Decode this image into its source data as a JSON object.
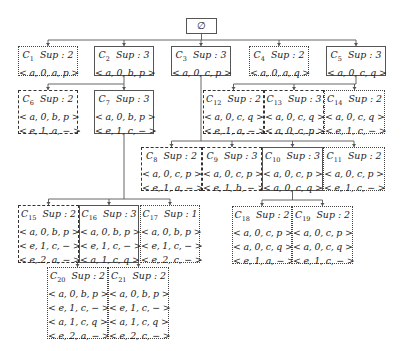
{
  "root": {
    "label": "∅",
    "box": [
      186,
      18,
      31,
      16
    ],
    "style": "solid"
  },
  "nodes": [
    {
      "id": "C1",
      "name": "C",
      "sub": "1",
      "sup_label": "Sup : 2",
      "tuples": [
        "< a, 0, a, p >"
      ],
      "style": "dotted",
      "box": [
        18,
        46,
        60,
        30
      ]
    },
    {
      "id": "C2",
      "name": "C",
      "sub": "2",
      "sup_label": "Sup : 3",
      "tuples": [
        "< a, 0, b, p >"
      ],
      "style": "solid",
      "box": [
        94,
        46,
        60,
        30
      ]
    },
    {
      "id": "C3",
      "name": "C",
      "sub": "3",
      "sup_label": "Sup : 3",
      "tuples": [
        "< a, 0, c, p >"
      ],
      "style": "solid",
      "box": [
        171,
        46,
        60,
        30
      ]
    },
    {
      "id": "C4",
      "name": "C",
      "sub": "4",
      "sup_label": "Sup : 2",
      "tuples": [
        "< a, 0, a, q >"
      ],
      "style": "dotted",
      "box": [
        249,
        46,
        60,
        30
      ]
    },
    {
      "id": "C5",
      "name": "C",
      "sub": "5",
      "sup_label": "Sup : 3",
      "tuples": [
        "< a, 0, c, q >"
      ],
      "style": "solid",
      "box": [
        326,
        46,
        60,
        30
      ]
    },
    {
      "id": "C6",
      "name": "C",
      "sub": "6",
      "sup_label": "Sup : 2",
      "tuples": [
        "< a, 0, b, p >",
        "< e, 1, a, − >"
      ],
      "style": "dashed",
      "box": [
        18,
        90,
        60,
        44
      ]
    },
    {
      "id": "C7",
      "name": "C",
      "sub": "7",
      "sup_label": "Sup : 3",
      "tuples": [
        "< a, 0, b, p >",
        "< e, 1, c, − >"
      ],
      "style": "solid",
      "box": [
        94,
        90,
        60,
        44
      ]
    },
    {
      "id": "C12",
      "name": "C",
      "sub": "12",
      "sup_label": "Sup : 2",
      "tuples": [
        "< a, 0, c, q >",
        "< e, 1, a, − >"
      ],
      "style": "dashed",
      "box": [
        203,
        90,
        61,
        44
      ]
    },
    {
      "id": "C13",
      "name": "C",
      "sub": "13",
      "sup_label": "Sup : 3",
      "tuples": [
        "< a, 0, c, q >",
        "< a, 0, c, p >"
      ],
      "style": "dashed",
      "box": [
        264,
        90,
        60,
        44
      ]
    },
    {
      "id": "C14",
      "name": "C",
      "sub": "14",
      "sup_label": "Sup : 2",
      "tuples": [
        "< a, 0, c, q >",
        "< e, 1, c, − >"
      ],
      "style": "dotted",
      "box": [
        324,
        90,
        61,
        44
      ]
    },
    {
      "id": "C8",
      "name": "C",
      "sub": "8",
      "sup_label": "Sup : 2",
      "tuples": [
        "< a, 0, c, p >",
        "< e, 1, a, − >"
      ],
      "style": "dashed",
      "box": [
        141,
        147,
        61,
        44
      ]
    },
    {
      "id": "C9",
      "name": "C",
      "sub": "9",
      "sup_label": "Sup : 3",
      "tuples": [
        "< a, 0, c, p >",
        "< e, 1, b, − >"
      ],
      "style": "dashed",
      "box": [
        202,
        147,
        60,
        44
      ]
    },
    {
      "id": "C10",
      "name": "C",
      "sub": "10",
      "sup_label": "Sup : 3",
      "tuples": [
        "< a, 0, c, p >",
        "< a, 0, c, q >"
      ],
      "style": "solid",
      "box": [
        262,
        147,
        61,
        44
      ]
    },
    {
      "id": "C11",
      "name": "C",
      "sub": "11",
      "sup_label": "Sup : 2",
      "tuples": [
        "< a, 0, c, p >",
        "< e, 1, c, − >"
      ],
      "style": "dotted",
      "box": [
        323,
        147,
        62,
        44
      ]
    },
    {
      "id": "C15",
      "name": "C",
      "sub": "15",
      "sup_label": "Sup : 2",
      "tuples": [
        "< a, 0, b, p >",
        "< e, 1, c, − >",
        "< e, 2, a, − >"
      ],
      "style": "dashed",
      "box": [
        18,
        205,
        61,
        58
      ]
    },
    {
      "id": "C16",
      "name": "C",
      "sub": "16",
      "sup_label": "Sup : 3",
      "tuples": [
        "< a, 0, b, p >",
        "< e, 1, c, − >",
        "< a, 1, c, q >"
      ],
      "style": "solid",
      "box": [
        79,
        205,
        60,
        58
      ]
    },
    {
      "id": "C17",
      "name": "C",
      "sub": "17",
      "sup_label": "Sup : 1",
      "tuples": [
        "< a, 0, b, p >",
        "< e, 1, c, − >",
        "< e, 2, c, − >"
      ],
      "style": "dotted",
      "box": [
        140,
        205,
        60,
        58
      ]
    },
    {
      "id": "C18",
      "name": "C",
      "sub": "18",
      "sup_label": "Sup : 2",
      "tuples": [
        "< a, 0, c, p >",
        "< a, 0, c, q >",
        "< e, 1, a, − >"
      ],
      "style": "dotted",
      "box": [
        232,
        206,
        60,
        58
      ]
    },
    {
      "id": "C19",
      "name": "C",
      "sub": "19",
      "sup_label": "Sup : 2",
      "tuples": [
        "< a, 0, c, p >",
        "< a, 0, c, q >",
        "< e, 1, c, − >"
      ],
      "style": "dotted",
      "box": [
        292,
        206,
        61,
        58
      ]
    },
    {
      "id": "C20",
      "name": "C",
      "sub": "20",
      "sup_label": "Sup : 2",
      "tuples": [
        "< a, 0, b, p >",
        "< e, 1, c, − >",
        "< a, 1, c, q >",
        "< e, 2, a, − >"
      ],
      "style": "dotted",
      "box": [
        47,
        267,
        61,
        72
      ]
    },
    {
      "id": "C21",
      "name": "C",
      "sub": "21",
      "sup_label": "Sup : 2",
      "tuples": [
        "< a, 0, b, p >",
        "< e, 1, c, − >",
        "< a, 1, c, q >",
        "< e, 2, c, − >"
      ],
      "style": "dotted",
      "box": [
        108,
        267,
        61,
        72
      ]
    }
  ],
  "edges": [
    {
      "from": "root",
      "to": [
        "C1",
        "C2",
        "C3",
        "C4",
        "C5"
      ]
    },
    {
      "from": "C2",
      "to": [
        "C6",
        "C7"
      ]
    },
    {
      "from": "C5",
      "to": [
        "C12",
        "C13",
        "C14"
      ]
    },
    {
      "from": "C3",
      "to": [
        "C8",
        "C9",
        "C10",
        "C11"
      ]
    },
    {
      "from": "C7",
      "to": [
        "C15",
        "C16",
        "C17"
      ]
    },
    {
      "from": "C10",
      "to": [
        "C18",
        "C19"
      ]
    },
    {
      "from": "C16",
      "to": [
        "C20",
        "C21"
      ]
    }
  ],
  "colors": {
    "line": "#555555",
    "text": "#222222",
    "background": "#ffffff"
  }
}
